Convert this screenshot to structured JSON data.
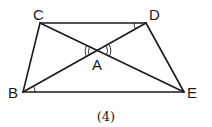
{
  "diagram": {
    "caption": "(4)",
    "points": {
      "C": "C",
      "D": "D",
      "B": "B",
      "E": "E",
      "A": "A"
    },
    "segments": [
      "CD",
      "BE",
      "CB",
      "DE",
      "CE",
      "DB"
    ],
    "angle_marks": [
      {
        "at": "A",
        "between": [
          "AC",
          "AB"
        ],
        "arcs": 2
      },
      {
        "at": "A",
        "between": [
          "AD",
          "AE"
        ],
        "arcs": 2
      },
      {
        "at": "D",
        "between": [
          "DC",
          "DB"
        ],
        "arcs": 1
      },
      {
        "at": "B",
        "between": [
          "BD",
          "BE"
        ],
        "arcs": 1
      }
    ]
  }
}
